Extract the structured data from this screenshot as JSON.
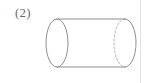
{
  "canvas": {
    "width": 145,
    "height": 83,
    "background_color": "#ffffff"
  },
  "figure": {
    "label": "(2)",
    "label_color": "#6b6b6b",
    "caption_position": "top-left",
    "shape_name": "cylinder",
    "stroke_color": "#8f8f8f",
    "hidden_stroke_color": "#b4b4b4",
    "stroke_width": 1,
    "fill": "none",
    "orientation": "horizontal",
    "geometry": {
      "left_ellipse": {
        "cx": 57,
        "cy": 43,
        "rx": 11,
        "ry": 24,
        "style": "solid",
        "note": "front circular face, fully visible"
      },
      "right_ellipse": {
        "cx": 125,
        "cy": 43,
        "rx": 11,
        "ry": 24,
        "right_half_style": "solid",
        "left_half_style": "dashed",
        "note": "far circular face, near half hidden"
      },
      "top_edge": {
        "x1": 57,
        "y1": 19,
        "x2": 125,
        "y2": 19,
        "style": "solid"
      },
      "bottom_edge": {
        "x1": 57,
        "y1": 67,
        "x2": 125,
        "y2": 67,
        "style": "solid"
      },
      "axis_length": 68,
      "dash_pattern": "2 2"
    }
  },
  "artifacts": {
    "right_margin_rule": {
      "name": "page-edge-line",
      "x": 140,
      "color": "#e2e2e2",
      "width": 1
    }
  }
}
